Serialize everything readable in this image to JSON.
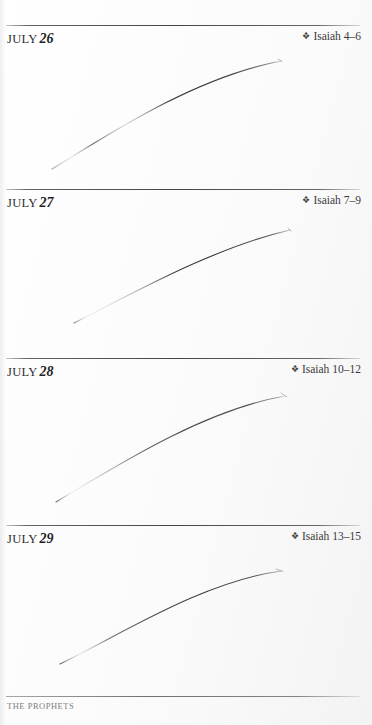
{
  "page": {
    "width": 372,
    "height": 725,
    "background_color": "#ffffff",
    "text_color": "#2b2b2b"
  },
  "entries": [
    {
      "month": "JULY",
      "day": "26",
      "bullet": "❖",
      "reference": "Isaiah 4–6",
      "rule_y": 25,
      "header_y": 29,
      "curve": {
        "name": "binding-shadow-curve",
        "x1": 52,
        "y1": 169,
        "cx1": 112,
        "cy1": 132,
        "cx2": 196,
        "cy2": 77,
        "x2": 281,
        "y2": 61
      }
    },
    {
      "month": "JULY",
      "day": "27",
      "bullet": "❖",
      "reference": "Isaiah 7–9",
      "rule_y": 189,
      "header_y": 193,
      "curve": {
        "name": "binding-shadow-curve",
        "x1": 74,
        "y1": 323,
        "cx1": 128,
        "cy1": 296,
        "cx2": 212,
        "cy2": 248,
        "x2": 290,
        "y2": 230
      }
    },
    {
      "month": "JULY",
      "day": "28",
      "bullet": "❖",
      "reference": "Isaiah 10–12",
      "rule_y": 358,
      "header_y": 362,
      "curve": {
        "name": "binding-shadow-curve",
        "x1": 56,
        "y1": 502,
        "cx1": 116,
        "cy1": 466,
        "cx2": 204,
        "cy2": 410,
        "x2": 285,
        "y2": 396
      }
    },
    {
      "month": "JULY",
      "day": "29",
      "bullet": "❖",
      "reference": "Isaiah 13–15",
      "rule_y": 525,
      "header_y": 529,
      "curve": {
        "name": "binding-shadow-curve",
        "x1": 60,
        "y1": 664,
        "cx1": 122,
        "cy1": 634,
        "cx2": 202,
        "cy2": 582,
        "x2": 281,
        "y2": 571
      }
    }
  ],
  "footer": {
    "label": "THE PROPHETS",
    "rule_y": 696,
    "label_y": 700
  }
}
